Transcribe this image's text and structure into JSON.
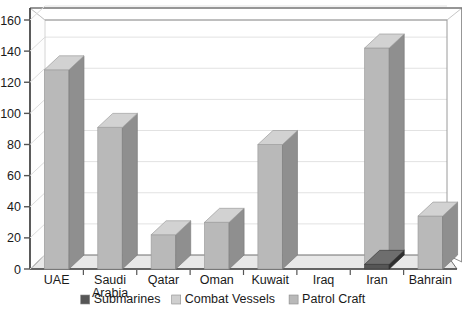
{
  "chart_data": {
    "type": "bar",
    "title": "",
    "subtitle": "",
    "xlabel": "",
    "ylabel": "",
    "ylim": [
      0,
      160
    ],
    "ytick_step": 20,
    "yticks": [
      "0",
      "20",
      "40",
      "60",
      "80",
      "100",
      "120",
      "140",
      "160"
    ],
    "grid": true,
    "grid_axis": "y",
    "style": "3d-column",
    "legend_position": "bottom",
    "categories": [
      "UAE",
      "Saudi Arabia",
      "Qatar",
      "Oman",
      "Kuwait",
      "Iraq",
      "Iran",
      "Bahrain"
    ],
    "category_labels_wrapped": [
      [
        "UAE"
      ],
      [
        "Saudi",
        "Arabia"
      ],
      [
        "Qatar"
      ],
      [
        "Oman"
      ],
      [
        "Kuwait"
      ],
      [
        "Iraq"
      ],
      [
        "Iran"
      ],
      [
        "Bahrain"
      ]
    ],
    "series": [
      {
        "name": "Submarines",
        "color": "#565656",
        "values": [
          0,
          0,
          0,
          0,
          0,
          0,
          3,
          0
        ]
      },
      {
        "name": "Combat Vessels",
        "color": "#c9c9c9",
        "values": [
          0,
          0,
          0,
          0,
          0,
          0,
          0,
          0
        ]
      },
      {
        "name": "Patrol Craft",
        "color": "#b4b4b4",
        "values": [
          128,
          91,
          22,
          30,
          80,
          0,
          142,
          34
        ]
      }
    ]
  },
  "legend": {
    "items": [
      {
        "label": "Submarines",
        "color": "#565656"
      },
      {
        "label": "Combat Vessels",
        "color": "#cfcfcf"
      },
      {
        "label": "Patrol Craft",
        "color": "#b9b9b9"
      }
    ]
  },
  "colors": {
    "bar_front": "#b9b9b9",
    "bar_top": "#d2d2d2",
    "bar_side": "#8f8f8f",
    "submarine_front": "#565656",
    "submarine_top": "#6e6e6e",
    "submarine_side": "#2f2f2f",
    "floor": "#e8e8e8",
    "floor_edge": "#7a7a7a",
    "wall": "#ffffff",
    "axis": "#555555",
    "grid": "#e2e2e2",
    "text": "#1a1a1a"
  }
}
